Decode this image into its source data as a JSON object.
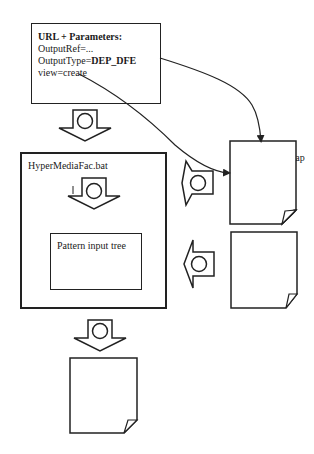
{
  "url_params_box": {
    "title": "URL + Parameters:",
    "lines": {
      "output_ref": "OutputRef=...",
      "output_type_key": "OutputType=",
      "output_type_value": "DEP_DFE",
      "view": "view=create"
    }
  },
  "hypermedia_box": {
    "title": "HyperMediaFac.bat",
    "inner": {
      "label": "Pattern input tree"
    }
  },
  "map_file": {
    "title_bold": "DEP_DFE",
    "title_ext": ".map",
    "lines": [
      "create=",
      "a_create=",
      "default="
    ]
  },
  "conversion_file": {
    "line1": "Conversion",
    "line2": "file"
  },
  "html_file": {
    "label": "HTML-File"
  },
  "steps": {
    "s1": "1",
    "s2": "2",
    "s3": "3",
    "s4": "4",
    "s5": "5"
  },
  "colors": {
    "stroke": "#222222",
    "background": "#ffffff"
  }
}
